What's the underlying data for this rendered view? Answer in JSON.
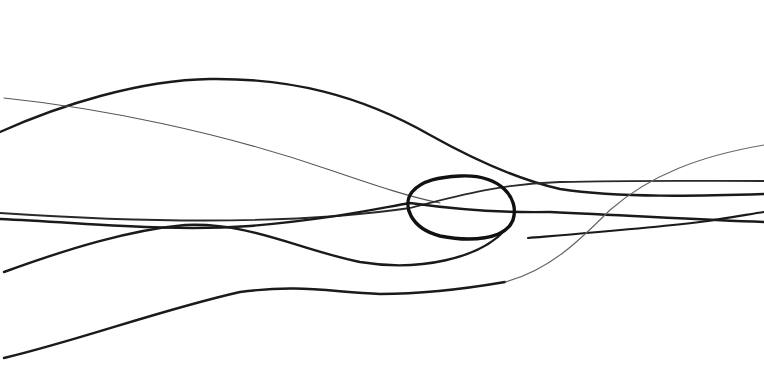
{
  "canvas": {
    "width": 764,
    "height": 379,
    "background": "#ffffff"
  },
  "strokes": [
    {
      "name": "arc-stroke",
      "color": "#1a1a1a",
      "width": 2.4,
      "d": "M 0 132 C 60 105, 140 80, 210 79 C 290 78, 360 95, 430 135 C 480 163, 520 180, 560 189 C 620 198, 700 196, 764 194"
    },
    {
      "name": "thin-diagonal-stroke",
      "color": "#555555",
      "width": 1.1,
      "d": "M 4 98 C 100 108, 220 132, 330 170 C 380 187, 410 197, 440 203"
    },
    {
      "name": "upper-right-line",
      "color": "#2a2a2a",
      "width": 1.8,
      "d": "M 0 213 C 120 221, 280 227, 410 208 C 460 195, 500 184, 560 182 C 640 180, 700 181, 764 181"
    },
    {
      "name": "mid-crossing-line",
      "color": "#1a1a1a",
      "width": 2.4,
      "d": "M 0 219 C 90 223, 170 232, 250 226 C 330 219, 370 210, 410 203 C 460 210, 500 213, 550 212 C 640 216, 700 220, 764 222"
    },
    {
      "name": "lower-loop-line",
      "color": "#1a1a1a",
      "width": 2.4,
      "d": "M 4 272 C 70 248, 130 230, 185 225 C 250 222, 300 250, 360 262 C 420 272, 480 258, 505 230"
    },
    {
      "name": "ellipse-stroke",
      "color": "#111111",
      "width": 3.4,
      "d": "M 460 176 C 500 174, 520 198, 513 220 C 505 240, 470 242, 440 236 C 410 228, 402 205, 412 192 C 422 180, 440 177, 460 176 Z"
    },
    {
      "name": "right-tail-line",
      "color": "#1a1a1a",
      "width": 2.2,
      "d": "M 528 238 C 600 232, 650 228, 700 222 C 730 218, 750 214, 764 212"
    },
    {
      "name": "bottom-wave-line",
      "color": "#1a1a1a",
      "width": 2.4,
      "d": "M 4 358 C 80 340, 160 310, 240 292 C 300 284, 330 292, 380 294 C 430 294, 470 288, 505 282"
    },
    {
      "name": "thin-rising-line",
      "color": "#666666",
      "width": 1.2,
      "d": "M 505 282 C 550 270, 580 240, 610 210 C 650 175, 700 156, 764 145"
    }
  ]
}
